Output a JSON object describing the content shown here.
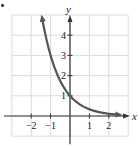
{
  "chart_data": {
    "type": "line",
    "title": "",
    "function": "y = 3^(-x)",
    "xlabel": "x",
    "ylabel": "y",
    "xlim": [
      -3,
      3
    ],
    "ylim": [
      -1,
      5
    ],
    "grid": true,
    "x_ticks": [
      -2,
      -1,
      1,
      2
    ],
    "x_tick_labels": [
      "−2",
      "−1",
      "1",
      "2"
    ],
    "y_ticks": [
      1,
      2,
      3,
      4
    ],
    "y_tick_labels": [
      "1",
      "2",
      "3",
      "4"
    ],
    "series": [
      {
        "name": "curve",
        "x": [
          -1.45,
          -1.25,
          -1,
          -0.75,
          -0.5,
          -0.25,
          0,
          0.25,
          0.5,
          0.75,
          1,
          1.25,
          1.5,
          1.75,
          2,
          2.25,
          2.6
        ],
        "y": [
          4.92,
          3.95,
          3.0,
          2.28,
          1.73,
          1.32,
          1.0,
          0.76,
          0.58,
          0.44,
          0.33,
          0.25,
          0.19,
          0.15,
          0.11,
          0.08,
          0.06
        ],
        "arrows": "both-ends",
        "color": "#555555"
      }
    ],
    "marker": "•"
  }
}
